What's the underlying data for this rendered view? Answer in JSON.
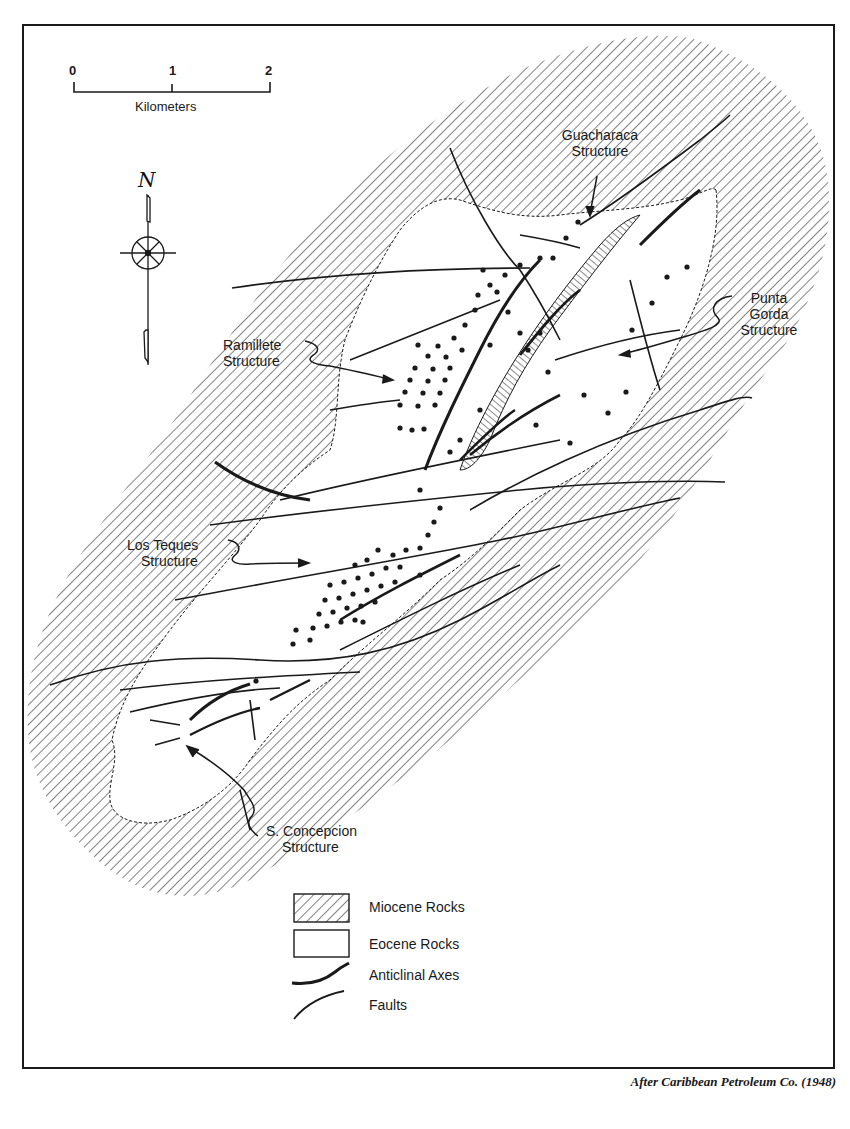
{
  "map": {
    "scale_bar": {
      "ticks": [
        "0",
        "1",
        "2"
      ],
      "unit": "Kilometers"
    },
    "north_arrow": {
      "label": "N"
    },
    "structures": [
      {
        "name": "guacharaca",
        "line1": "Guacharaca",
        "line2": "Structure"
      },
      {
        "name": "punta-gorda",
        "line1": "Punta",
        "line2": "Gorda",
        "line3": "Structure"
      },
      {
        "name": "ramillete",
        "line1": "Ramillete",
        "line2": "Structure"
      },
      {
        "name": "los-teques",
        "line1": "Los Teques",
        "line2": "Structure"
      },
      {
        "name": "s-concepcion",
        "line1": "S. Concepcion",
        "line2": "Structure"
      }
    ],
    "legend": [
      {
        "key": "miocene",
        "label": "Miocene Rocks"
      },
      {
        "key": "eocene",
        "label": "Eocene Rocks"
      },
      {
        "key": "anticline",
        "label": "Anticlinal Axes"
      },
      {
        "key": "fault",
        "label": "Faults"
      }
    ],
    "credit": "After Caribbean Petroleum Co. (1948)",
    "colors": {
      "ink": "#1a1a1a",
      "paper": "#ffffff"
    }
  }
}
